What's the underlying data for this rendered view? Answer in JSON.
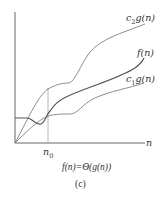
{
  "figure": {
    "caption_formula": "f(n)=Θ(g(n))",
    "caption_panel": "(c)",
    "x_axis_label": "n",
    "threshold_label": "n0",
    "curves": [
      {
        "name": "c2g(n)",
        "label_main": "c",
        "label_sub": "2",
        "label_rest": "g(n)",
        "color": "#707070"
      },
      {
        "name": "f(n)",
        "label": "f(n)",
        "color": "#555555"
      },
      {
        "name": "c1g(n)",
        "label_main": "c",
        "label_sub": "1",
        "label_rest": "g(n)",
        "color": "#707070"
      }
    ],
    "threshold_line_color": "#b8b8b8",
    "axis_color": "#555555"
  }
}
